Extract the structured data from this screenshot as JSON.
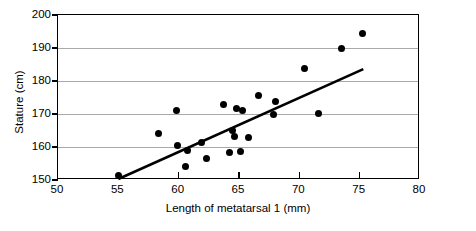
{
  "chart_data": {
    "type": "scatter",
    "title": "",
    "xlabel": "Length of metatarsal 1 (mm)",
    "ylabel": "Stature (cm)",
    "xlim": [
      50,
      80
    ],
    "ylim": [
      150,
      200
    ],
    "xticks": [
      50,
      55,
      60,
      65,
      70,
      75,
      80
    ],
    "yticks": [
      150,
      160,
      170,
      180,
      190,
      200
    ],
    "xtick_labels": [
      "50",
      "55",
      "60",
      "65",
      "70",
      "75",
      "80"
    ],
    "ytick_labels": [
      "150",
      "160",
      "170",
      "180",
      "190",
      "200"
    ],
    "grid": "horizontal",
    "legend": null,
    "points": [
      {
        "x": 55.0,
        "y": 151.3
      },
      {
        "x": 58.3,
        "y": 164.0
      },
      {
        "x": 59.8,
        "y": 171.2
      },
      {
        "x": 59.9,
        "y": 160.5
      },
      {
        "x": 60.7,
        "y": 158.8
      },
      {
        "x": 60.6,
        "y": 154.2
      },
      {
        "x": 61.9,
        "y": 161.5
      },
      {
        "x": 62.3,
        "y": 156.5
      },
      {
        "x": 63.7,
        "y": 173.0
      },
      {
        "x": 64.2,
        "y": 158.4
      },
      {
        "x": 64.5,
        "y": 165.0
      },
      {
        "x": 64.6,
        "y": 163.3
      },
      {
        "x": 64.8,
        "y": 171.8
      },
      {
        "x": 65.3,
        "y": 171.0
      },
      {
        "x": 65.1,
        "y": 158.6
      },
      {
        "x": 65.8,
        "y": 163.0
      },
      {
        "x": 66.6,
        "y": 175.5
      },
      {
        "x": 67.9,
        "y": 170.0
      },
      {
        "x": 68.0,
        "y": 173.8
      },
      {
        "x": 71.6,
        "y": 170.2
      },
      {
        "x": 70.4,
        "y": 183.8
      },
      {
        "x": 73.5,
        "y": 190.0
      },
      {
        "x": 75.2,
        "y": 194.3
      }
    ],
    "trend_line": {
      "x_start": 55.0,
      "y_start": 150.3,
      "x_end": 75.3,
      "y_end": 183.6
    }
  }
}
